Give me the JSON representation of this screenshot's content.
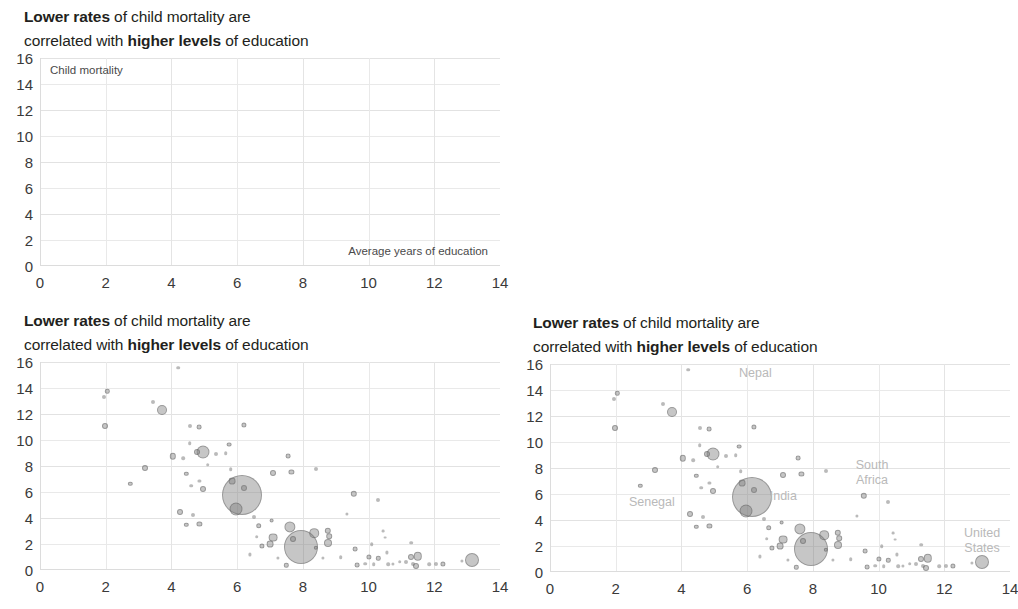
{
  "figure": {
    "title_part1_bold": "Lower rates",
    "title_part2": " of child mortality are",
    "title_part3": "correlated with ",
    "title_part4_bold": "higher levels",
    "title_part5": " of education",
    "y_axis_note": "Child mortality",
    "x_axis_note": "Average years of education"
  },
  "chart_data": {
    "type": "scatter",
    "title": "Lower rates of child mortality are correlated with higher levels of education",
    "xlabel": "Average years of education",
    "ylabel": "Child mortality",
    "xlim": [
      0,
      14
    ],
    "ylim": [
      0,
      16
    ],
    "xticks": [
      0,
      2,
      4,
      6,
      8,
      10,
      12,
      14
    ],
    "yticks": [
      0,
      2,
      4,
      6,
      8,
      10,
      12,
      14,
      16
    ],
    "grid": true,
    "legend": "none",
    "bubble_encoding": "marker area ~ population",
    "panels": [
      {
        "id": "panel-top-left",
        "name": "empty-axes-panel",
        "description": "Axes only, no data points plotted",
        "points": [],
        "annotations": []
      },
      {
        "id": "panel-bottom-left",
        "name": "scatter-panel-unlabeled",
        "description": "Bubble scatter without country annotations",
        "annotations": [],
        "points": [
          {
            "x": 1.95,
            "y": 13.3,
            "r": 2.0
          },
          {
            "x": 2.05,
            "y": 13.75,
            "r": 2.2
          },
          {
            "x": 1.98,
            "y": 11.05,
            "r": 3.0
          },
          {
            "x": 3.45,
            "y": 12.95,
            "r": 2.0
          },
          {
            "x": 3.7,
            "y": 12.3,
            "r": 5.0
          },
          {
            "x": 4.2,
            "y": 15.55,
            "r": 1.8
          },
          {
            "x": 4.55,
            "y": 11.05,
            "r": 2.0
          },
          {
            "x": 4.85,
            "y": 11.0,
            "r": 2.4
          },
          {
            "x": 6.2,
            "y": 11.15,
            "r": 2.6
          },
          {
            "x": 2.75,
            "y": 6.65,
            "r": 2.2
          },
          {
            "x": 3.2,
            "y": 7.85,
            "r": 3.0
          },
          {
            "x": 4.05,
            "y": 8.75,
            "r": 3.2
          },
          {
            "x": 4.35,
            "y": 8.6,
            "r": 1.8
          },
          {
            "x": 4.55,
            "y": 9.75,
            "r": 1.8
          },
          {
            "x": 4.95,
            "y": 9.1,
            "r": 6.5
          },
          {
            "x": 4.78,
            "y": 9.05,
            "r": 3.0
          },
          {
            "x": 5.1,
            "y": 8.1,
            "r": 1.8
          },
          {
            "x": 5.35,
            "y": 8.95,
            "r": 2.0
          },
          {
            "x": 5.65,
            "y": 9.0,
            "r": 1.8
          },
          {
            "x": 5.75,
            "y": 9.65,
            "r": 2.4
          },
          {
            "x": 5.8,
            "y": 7.75,
            "r": 1.8
          },
          {
            "x": 4.45,
            "y": 7.4,
            "r": 2.2
          },
          {
            "x": 4.6,
            "y": 6.5,
            "r": 1.8
          },
          {
            "x": 4.95,
            "y": 6.25,
            "r": 3.0
          },
          {
            "x": 4.85,
            "y": 6.85,
            "r": 1.6
          },
          {
            "x": 5.85,
            "y": 6.85,
            "r": 3.4
          },
          {
            "x": 6.2,
            "y": 6.3,
            "r": 3.0
          },
          {
            "x": 6.15,
            "y": 5.8,
            "r": 20.0
          },
          {
            "x": 5.95,
            "y": 4.7,
            "r": 6.5
          },
          {
            "x": 6.5,
            "y": 4.1,
            "r": 2.0
          },
          {
            "x": 7.1,
            "y": 7.5,
            "r": 3.0
          },
          {
            "x": 7.65,
            "y": 7.55,
            "r": 2.6
          },
          {
            "x": 7.55,
            "y": 8.75,
            "r": 2.4
          },
          {
            "x": 8.4,
            "y": 7.8,
            "r": 2.0
          },
          {
            "x": 4.25,
            "y": 4.5,
            "r": 3.0
          },
          {
            "x": 4.45,
            "y": 3.5,
            "r": 2.2
          },
          {
            "x": 4.65,
            "y": 4.2,
            "r": 2.0
          },
          {
            "x": 4.85,
            "y": 3.55,
            "r": 2.6
          },
          {
            "x": 6.65,
            "y": 3.4,
            "r": 2.8
          },
          {
            "x": 7.05,
            "y": 3.8,
            "r": 2.4
          },
          {
            "x": 6.6,
            "y": 2.55,
            "r": 1.8
          },
          {
            "x": 6.75,
            "y": 1.85,
            "r": 2.6
          },
          {
            "x": 7.0,
            "y": 2.0,
            "r": 3.4
          },
          {
            "x": 7.1,
            "y": 2.5,
            "r": 4.4
          },
          {
            "x": 7.6,
            "y": 3.3,
            "r": 5.6
          },
          {
            "x": 7.95,
            "y": 1.8,
            "r": 17.0
          },
          {
            "x": 7.7,
            "y": 2.35,
            "r": 3.0
          },
          {
            "x": 8.35,
            "y": 2.85,
            "r": 4.8
          },
          {
            "x": 8.75,
            "y": 3.0,
            "r": 3.2
          },
          {
            "x": 8.8,
            "y": 2.6,
            "r": 2.8
          },
          {
            "x": 8.75,
            "y": 2.1,
            "r": 4.0
          },
          {
            "x": 8.4,
            "y": 1.7,
            "r": 2.2
          },
          {
            "x": 6.4,
            "y": 1.2,
            "r": 1.6
          },
          {
            "x": 7.5,
            "y": 0.35,
            "r": 2.2
          },
          {
            "x": 7.25,
            "y": 0.9,
            "r": 1.6
          },
          {
            "x": 8.6,
            "y": 0.95,
            "r": 1.6
          },
          {
            "x": 9.15,
            "y": 1.0,
            "r": 1.8
          },
          {
            "x": 9.6,
            "y": 1.6,
            "r": 2.4
          },
          {
            "x": 9.55,
            "y": 5.85,
            "r": 3.2
          },
          {
            "x": 10.3,
            "y": 5.4,
            "r": 2.0
          },
          {
            "x": 9.35,
            "y": 4.3,
            "r": 1.6
          },
          {
            "x": 9.65,
            "y": 0.4,
            "r": 2.4
          },
          {
            "x": 10.0,
            "y": 1.0,
            "r": 2.6
          },
          {
            "x": 9.9,
            "y": 0.5,
            "r": 1.8
          },
          {
            "x": 10.15,
            "y": 0.45,
            "r": 1.8
          },
          {
            "x": 10.3,
            "y": 0.9,
            "r": 2.2
          },
          {
            "x": 10.1,
            "y": 2.0,
            "r": 1.8
          },
          {
            "x": 10.55,
            "y": 1.35,
            "r": 1.6
          },
          {
            "x": 10.6,
            "y": 0.45,
            "r": 1.8
          },
          {
            "x": 10.75,
            "y": 0.5,
            "r": 1.6
          },
          {
            "x": 10.45,
            "y": 3.0,
            "r": 1.4
          },
          {
            "x": 10.5,
            "y": 2.5,
            "r": 1.4
          },
          {
            "x": 10.95,
            "y": 0.65,
            "r": 1.8
          },
          {
            "x": 11.15,
            "y": 0.6,
            "r": 2.0
          },
          {
            "x": 11.35,
            "y": 0.45,
            "r": 2.0
          },
          {
            "x": 11.3,
            "y": 1.0,
            "r": 3.0
          },
          {
            "x": 11.5,
            "y": 1.05,
            "r": 4.2
          },
          {
            "x": 11.45,
            "y": 0.3,
            "r": 3.0
          },
          {
            "x": 11.3,
            "y": 2.1,
            "r": 1.8
          },
          {
            "x": 11.85,
            "y": 0.45,
            "r": 1.8
          },
          {
            "x": 12.05,
            "y": 0.5,
            "r": 2.0
          },
          {
            "x": 12.25,
            "y": 0.5,
            "r": 2.6
          },
          {
            "x": 12.85,
            "y": 0.7,
            "r": 1.6
          },
          {
            "x": 13.15,
            "y": 0.75,
            "r": 7.0
          }
        ]
      },
      {
        "id": "panel-bottom-right",
        "name": "scatter-panel-annotated",
        "description": "Same bubble scatter with selected country annotations",
        "annotations": [
          {
            "label": "Nepal",
            "x": 6.25,
            "y": 15.3
          },
          {
            "label": "Senegal",
            "x": 3.1,
            "y": 5.35
          },
          {
            "label": "India",
            "x": 7.1,
            "y": 5.85
          },
          {
            "label": "South\nAfrica",
            "x": 9.8,
            "y": 7.65
          },
          {
            "label": "United\nStates",
            "x": 13.15,
            "y": 2.35
          }
        ],
        "points": [
          {
            "x": 1.95,
            "y": 13.3,
            "r": 2.0
          },
          {
            "x": 2.05,
            "y": 13.75,
            "r": 2.2
          },
          {
            "x": 1.98,
            "y": 11.05,
            "r": 3.0
          },
          {
            "x": 3.45,
            "y": 12.95,
            "r": 2.0
          },
          {
            "x": 3.7,
            "y": 12.3,
            "r": 5.0
          },
          {
            "x": 4.2,
            "y": 15.55,
            "r": 1.8
          },
          {
            "x": 4.55,
            "y": 11.05,
            "r": 2.0
          },
          {
            "x": 4.85,
            "y": 11.0,
            "r": 2.4
          },
          {
            "x": 6.2,
            "y": 11.15,
            "r": 2.6
          },
          {
            "x": 2.75,
            "y": 6.65,
            "r": 2.2
          },
          {
            "x": 3.2,
            "y": 7.85,
            "r": 3.0
          },
          {
            "x": 4.05,
            "y": 8.75,
            "r": 3.2
          },
          {
            "x": 4.35,
            "y": 8.6,
            "r": 1.8
          },
          {
            "x": 4.55,
            "y": 9.75,
            "r": 1.8
          },
          {
            "x": 4.95,
            "y": 9.1,
            "r": 6.5
          },
          {
            "x": 4.78,
            "y": 9.05,
            "r": 3.0
          },
          {
            "x": 5.1,
            "y": 8.1,
            "r": 1.8
          },
          {
            "x": 5.35,
            "y": 8.95,
            "r": 2.0
          },
          {
            "x": 5.65,
            "y": 9.0,
            "r": 1.8
          },
          {
            "x": 5.75,
            "y": 9.65,
            "r": 2.4
          },
          {
            "x": 5.8,
            "y": 7.75,
            "r": 1.8
          },
          {
            "x": 4.45,
            "y": 7.4,
            "r": 2.2
          },
          {
            "x": 4.6,
            "y": 6.5,
            "r": 1.8
          },
          {
            "x": 4.95,
            "y": 6.25,
            "r": 3.0
          },
          {
            "x": 4.85,
            "y": 6.85,
            "r": 1.6
          },
          {
            "x": 5.85,
            "y": 6.85,
            "r": 3.4
          },
          {
            "x": 6.2,
            "y": 6.3,
            "r": 3.0
          },
          {
            "x": 6.15,
            "y": 5.8,
            "r": 20.0
          },
          {
            "x": 5.95,
            "y": 4.7,
            "r": 6.5
          },
          {
            "x": 6.5,
            "y": 4.1,
            "r": 2.0
          },
          {
            "x": 7.1,
            "y": 7.5,
            "r": 3.0
          },
          {
            "x": 7.65,
            "y": 7.55,
            "r": 2.6
          },
          {
            "x": 7.55,
            "y": 8.75,
            "r": 2.4
          },
          {
            "x": 8.4,
            "y": 7.8,
            "r": 2.0
          },
          {
            "x": 4.25,
            "y": 4.5,
            "r": 3.0
          },
          {
            "x": 4.45,
            "y": 3.5,
            "r": 2.2
          },
          {
            "x": 4.65,
            "y": 4.2,
            "r": 2.0
          },
          {
            "x": 4.85,
            "y": 3.55,
            "r": 2.6
          },
          {
            "x": 6.65,
            "y": 3.4,
            "r": 2.8
          },
          {
            "x": 7.05,
            "y": 3.8,
            "r": 2.4
          },
          {
            "x": 6.6,
            "y": 2.55,
            "r": 1.8
          },
          {
            "x": 6.75,
            "y": 1.85,
            "r": 2.6
          },
          {
            "x": 7.0,
            "y": 2.0,
            "r": 3.4
          },
          {
            "x": 7.1,
            "y": 2.5,
            "r": 4.4
          },
          {
            "x": 7.6,
            "y": 3.3,
            "r": 5.6
          },
          {
            "x": 7.95,
            "y": 1.8,
            "r": 17.0
          },
          {
            "x": 7.7,
            "y": 2.35,
            "r": 3.0
          },
          {
            "x": 8.35,
            "y": 2.85,
            "r": 4.8
          },
          {
            "x": 8.75,
            "y": 3.0,
            "r": 3.2
          },
          {
            "x": 8.8,
            "y": 2.6,
            "r": 2.8
          },
          {
            "x": 8.75,
            "y": 2.1,
            "r": 4.0
          },
          {
            "x": 8.4,
            "y": 1.7,
            "r": 2.2
          },
          {
            "x": 6.4,
            "y": 1.2,
            "r": 1.6
          },
          {
            "x": 7.5,
            "y": 0.35,
            "r": 2.2
          },
          {
            "x": 7.25,
            "y": 0.9,
            "r": 1.6
          },
          {
            "x": 8.6,
            "y": 0.95,
            "r": 1.6
          },
          {
            "x": 9.15,
            "y": 1.0,
            "r": 1.8
          },
          {
            "x": 9.6,
            "y": 1.6,
            "r": 2.4
          },
          {
            "x": 9.55,
            "y": 5.85,
            "r": 3.2
          },
          {
            "x": 10.3,
            "y": 5.4,
            "r": 2.0
          },
          {
            "x": 9.35,
            "y": 4.3,
            "r": 1.6
          },
          {
            "x": 9.65,
            "y": 0.4,
            "r": 2.4
          },
          {
            "x": 10.0,
            "y": 1.0,
            "r": 2.6
          },
          {
            "x": 9.9,
            "y": 0.5,
            "r": 1.8
          },
          {
            "x": 10.15,
            "y": 0.45,
            "r": 1.8
          },
          {
            "x": 10.3,
            "y": 0.9,
            "r": 2.2
          },
          {
            "x": 10.1,
            "y": 2.0,
            "r": 1.8
          },
          {
            "x": 10.55,
            "y": 1.35,
            "r": 1.6
          },
          {
            "x": 10.6,
            "y": 0.45,
            "r": 1.8
          },
          {
            "x": 10.75,
            "y": 0.5,
            "r": 1.6
          },
          {
            "x": 10.45,
            "y": 3.0,
            "r": 1.4
          },
          {
            "x": 10.5,
            "y": 2.5,
            "r": 1.4
          },
          {
            "x": 10.95,
            "y": 0.65,
            "r": 1.8
          },
          {
            "x": 11.15,
            "y": 0.6,
            "r": 2.0
          },
          {
            "x": 11.35,
            "y": 0.45,
            "r": 2.0
          },
          {
            "x": 11.3,
            "y": 1.0,
            "r": 3.0
          },
          {
            "x": 11.5,
            "y": 1.05,
            "r": 4.2
          },
          {
            "x": 11.45,
            "y": 0.3,
            "r": 3.0
          },
          {
            "x": 11.3,
            "y": 2.1,
            "r": 1.8
          },
          {
            "x": 11.85,
            "y": 0.45,
            "r": 1.8
          },
          {
            "x": 12.05,
            "y": 0.5,
            "r": 2.0
          },
          {
            "x": 12.25,
            "y": 0.5,
            "r": 2.6
          },
          {
            "x": 12.85,
            "y": 0.7,
            "r": 1.6
          },
          {
            "x": 13.15,
            "y": 0.75,
            "r": 7.0
          }
        ]
      }
    ]
  }
}
